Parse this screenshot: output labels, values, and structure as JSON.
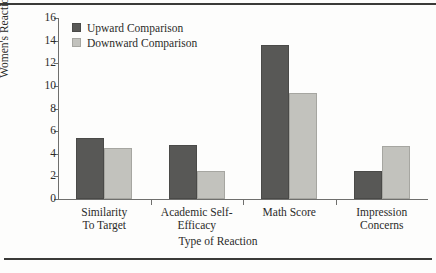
{
  "chart_data": {
    "type": "bar",
    "title": "",
    "xlabel": "Type of Reaction",
    "ylabel": "Women's Reactions",
    "categories": [
      "Similarity\nTo Target",
      "Academic Self-\nEfficacy",
      "Math Score",
      "Impression\nConcerns"
    ],
    "category_lines": [
      [
        "Similarity",
        "To Target"
      ],
      [
        "Academic Self-",
        "Efficacy"
      ],
      [
        "Math Score",
        ""
      ],
      [
        "Impression",
        "Concerns"
      ]
    ],
    "series": [
      {
        "name": "Upward Comparison",
        "values": [
          5.4,
          4.8,
          13.6,
          2.5
        ],
        "color": "#585856"
      },
      {
        "name": "Downward Comparison",
        "values": [
          4.5,
          2.5,
          9.4,
          4.7
        ],
        "color": "#c2c2bd"
      }
    ],
    "ylim": [
      0,
      16
    ],
    "yticks": [
      0,
      2,
      4,
      6,
      8,
      10,
      12,
      14,
      16
    ],
    "ytick_labels": [
      "0",
      "2",
      "4",
      "6",
      "8",
      "10",
      "12",
      "14",
      "16"
    ],
    "grid": false,
    "legend_position": "top-left-inside"
  },
  "legend": {
    "items": [
      {
        "label": "Upward Comparison",
        "swatch": "dark-gray-swatch-icon"
      },
      {
        "label": "Downward Comparison",
        "swatch": "light-gray-swatch-icon"
      }
    ]
  },
  "colors": {
    "upward": "#585856",
    "downward": "#c2c2bd",
    "axis": "#6f6f6d",
    "text": "#2b2b29",
    "rule": "#3a3a38",
    "background": "#fdfdfc"
  }
}
